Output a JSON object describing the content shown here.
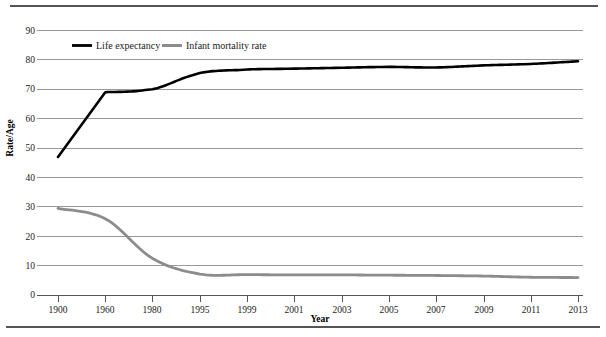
{
  "figure": {
    "top_rule": "horizontal-rule",
    "bottom_rule": "horizontal-rule"
  },
  "chart_data": {
    "type": "line",
    "title": "",
    "xlabel": "Year",
    "ylabel": "Rate/Age",
    "ylim": [
      0,
      90
    ],
    "yticks": [
      0,
      10,
      20,
      30,
      40,
      50,
      60,
      70,
      80,
      90
    ],
    "grid": true,
    "legend_position": "top-left-inside",
    "categories": [
      "1900",
      "1960",
      "1980",
      "1995",
      "1999",
      "2001",
      "2003",
      "2005",
      "2007",
      "2009",
      "2011",
      "2013"
    ],
    "series": [
      {
        "name": "Life expectancy",
        "color": "#000000",
        "values": [
          47.0,
          69.0,
          70.0,
          75.5,
          76.7,
          77.0,
          77.3,
          77.6,
          77.4,
          78.1,
          78.6,
          79.5
        ]
      },
      {
        "name": "Infant mortality rate",
        "color": "#8c8c8c",
        "values": [
          29.5,
          26.0,
          12.5,
          7.2,
          7.0,
          6.9,
          6.9,
          6.8,
          6.7,
          6.5,
          6.1,
          6.0
        ]
      }
    ]
  },
  "axes": {
    "y_tick_labels": [
      "90",
      "80",
      "70",
      "60",
      "50",
      "40",
      "30",
      "20",
      "10",
      "0"
    ],
    "x_tick_labels": [
      "1900",
      "1960",
      "1980",
      "1995",
      "1999",
      "2001",
      "2003",
      "2005",
      "2007",
      "2009",
      "2011",
      "2013"
    ],
    "y_axis_title": "Rate/Age",
    "x_axis_title": "Year"
  },
  "legend": {
    "items": [
      {
        "label": "Life expectancy",
        "color": "#000000"
      },
      {
        "label": "Infant mortality rate",
        "color": "#8c8c8c"
      }
    ]
  },
  "colors": {
    "life_expectancy": "#000000",
    "infant_mortality": "#8c8c8c",
    "gridline": "#9a9a9a",
    "axis": "#555555",
    "background": "#ffffff"
  }
}
